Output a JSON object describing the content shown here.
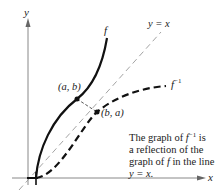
{
  "figure": {
    "axes": {
      "x_label": "x",
      "y_label": "y"
    },
    "curves": {
      "f_label": "f",
      "f_inverse_label": "f",
      "f_inverse_superscript": "−1",
      "diagonal_label": "y = x"
    },
    "points": {
      "point_ab": "(a, b)",
      "point_ba": "(b, a)"
    },
    "caption": {
      "line1_a": "The graph of ",
      "line1_f": "f",
      "line1_sup": "−1",
      "line1_b": " is",
      "line2": "a reflection of the",
      "line3_a": "graph of ",
      "line3_f": "f",
      "line3_b": " in the line",
      "line4": "y = x."
    },
    "colors": {
      "ink": "#222222",
      "axis": "#888888",
      "diagonal": "#999999"
    }
  }
}
